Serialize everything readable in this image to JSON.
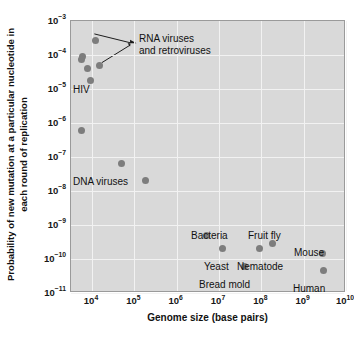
{
  "figure": {
    "top_caption_fragment": "",
    "x_axis_title": "Genome size (base pairs)",
    "y_axis_title": "Probability of new mutation at a particular nucleotide in each round of replication"
  },
  "axes": {
    "x_ticks": [
      {
        "mantissa": "10",
        "exp": "4"
      },
      {
        "mantissa": "10",
        "exp": "5"
      },
      {
        "mantissa": "10",
        "exp": "6"
      },
      {
        "mantissa": "10",
        "exp": "7"
      },
      {
        "mantissa": "10",
        "exp": "8"
      },
      {
        "mantissa": "10",
        "exp": "9"
      },
      {
        "mantissa": "10",
        "exp": "10"
      }
    ],
    "y_ticks": [
      {
        "mantissa": "10",
        "exp": "−3"
      },
      {
        "mantissa": "10",
        "exp": "−4"
      },
      {
        "mantissa": "10",
        "exp": "−5"
      },
      {
        "mantissa": "10",
        "exp": "−6"
      },
      {
        "mantissa": "10",
        "exp": "−7"
      },
      {
        "mantissa": "10",
        "exp": "−8"
      },
      {
        "mantissa": "10",
        "exp": "−9"
      },
      {
        "mantissa": "10",
        "exp": "−10"
      },
      {
        "mantissa": "10",
        "exp": "−11"
      }
    ]
  },
  "annotations": {
    "rna_viruses": "RNA viruses\nand retroviruses",
    "hiv": "HIV",
    "dna_viruses": "DNA viruses",
    "bacteria": "Bacteria",
    "yeast": "Yeast",
    "bread_mold": "Bread mold",
    "nematode": "Nematode",
    "fruit_fly": "Fruit fly",
    "mouse": "Mouse",
    "human": "Human"
  },
  "colors": {
    "plot_background": "#d9d9d9",
    "point": "#7d7d7d",
    "gridline": "#f2f2f2",
    "text": "#111111",
    "frame": "#9a9a9a"
  },
  "chart_data": {
    "type": "scatter",
    "title": "",
    "xlabel": "Genome size (base pairs)",
    "ylabel": "Probability of new mutation at a particular nucleotide in each round of replication",
    "xscale": "log",
    "yscale": "log",
    "xlim": [
      3000,
      10000000000
    ],
    "ylim": [
      1e-11,
      0.001
    ],
    "grid": true,
    "legend": false,
    "points": [
      {
        "label": "RNA virus",
        "group": "RNA viruses and retroviruses",
        "x": 12000,
        "y": 0.00026
      },
      {
        "label": "RNA virus",
        "group": "RNA viruses and retroviruses",
        "x": 6000,
        "y": 9e-05
      },
      {
        "label": "RNA virus",
        "group": "RNA viruses and retroviruses",
        "x": 5600,
        "y": 7.2e-05
      },
      {
        "label": "RNA virus",
        "group": "RNA viruses and retroviruses",
        "x": 8000,
        "y": 4e-05
      },
      {
        "label": "RNA virus",
        "group": "RNA viruses and retroviruses",
        "x": 15000,
        "y": 5e-05
      },
      {
        "label": "HIV",
        "group": "RNA viruses and retroviruses",
        "x": 9000,
        "y": 1.8e-05
      },
      {
        "label": "DNA virus",
        "group": "DNA viruses",
        "x": 5500,
        "y": 6e-07
      },
      {
        "label": "DNA virus",
        "group": "DNA viruses",
        "x": 50000,
        "y": 6.5e-08
      },
      {
        "label": "DNA virus",
        "group": "DNA viruses",
        "x": 180000,
        "y": 2.1e-08
      },
      {
        "label": "Bacteria",
        "group": "organism",
        "x": 5000000,
        "y": 4.8e-10
      },
      {
        "label": "Yeast",
        "group": "organism",
        "x": 12000000,
        "y": 2.1e-10
      },
      {
        "label": "Bread mold",
        "group": "organism",
        "x": 40000000,
        "y": 6e-11
      },
      {
        "label": "Nematode",
        "group": "organism",
        "x": 90000000,
        "y": 2.1e-10
      },
      {
        "label": "Fruit fly",
        "group": "organism",
        "x": 180000000,
        "y": 2.8e-10
      },
      {
        "label": "Mouse",
        "group": "organism",
        "x": 2800000000,
        "y": 1.5e-10
      },
      {
        "label": "Human",
        "group": "organism",
        "x": 3000000000,
        "y": 4.5e-11
      }
    ]
  }
}
